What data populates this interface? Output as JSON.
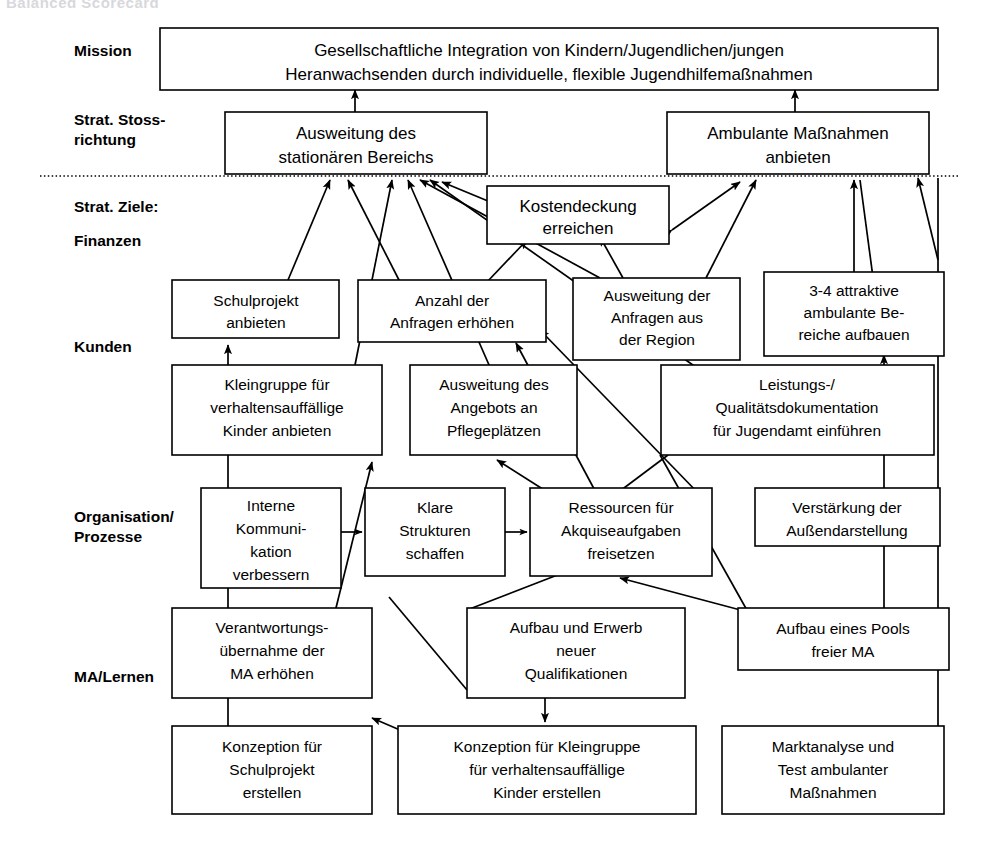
{
  "page": {
    "title": "Balanced Scorecard",
    "width": 1001,
    "height": 841,
    "background": "#ffffff",
    "ink": "#000000"
  },
  "row_labels": [
    {
      "id": "mission",
      "lines": [
        "Mission"
      ]
    },
    {
      "id": "stossrichtung",
      "lines": [
        "Strat. Stoss-",
        "richtung"
      ]
    },
    {
      "id": "ziele",
      "lines": [
        "Strat. Ziele:"
      ]
    },
    {
      "id": "finanzen",
      "lines": [
        "Finanzen"
      ]
    },
    {
      "id": "kunden",
      "lines": [
        "Kunden"
      ]
    },
    {
      "id": "organisation",
      "lines": [
        "Organisation/",
        "Prozesse"
      ]
    },
    {
      "id": "malernen",
      "lines": [
        "MA/Lernen"
      ]
    }
  ],
  "boxes": [
    {
      "id": "mission",
      "lines": [
        "Gesellschaftliche Integration von Kindern/Jugendlichen/jungen",
        "Heranwachsenden durch individuelle, flexible Jugendhilfemaßnahmen"
      ]
    },
    {
      "id": "ausweitung-stat",
      "lines": [
        "Ausweitung des",
        "stationären Bereichs"
      ]
    },
    {
      "id": "ambulante-massn",
      "lines": [
        "Ambulante Maßnahmen",
        "anbieten"
      ]
    },
    {
      "id": "kostendeckung",
      "lines": [
        "Kostendeckung",
        "erreichen"
      ]
    },
    {
      "id": "schulprojekt",
      "lines": [
        "Schulprojekt",
        "anbieten"
      ]
    },
    {
      "id": "anzahl-anfragen",
      "lines": [
        "Anzahl der",
        "Anfragen erhöhen"
      ]
    },
    {
      "id": "ausweitung-region",
      "lines": [
        "Ausweitung der",
        "Anfragen aus",
        "der Region"
      ]
    },
    {
      "id": "attraktive-bereiche",
      "lines": [
        "3-4 attraktive",
        "ambulante Be-",
        "reiche aufbauen"
      ]
    },
    {
      "id": "kleingruppe",
      "lines": [
        "Kleingruppe für",
        "verhaltensauffällige",
        "Kinder anbieten"
      ]
    },
    {
      "id": "pflegeplaetze",
      "lines": [
        "Ausweitung des",
        "Angebots an",
        "Pflegeplätzen"
      ]
    },
    {
      "id": "qualitaetsdok",
      "lines": [
        "Leistungs-/",
        "Qualitätsdokumentation",
        "für Jugendamt einführen"
      ]
    },
    {
      "id": "interne-kommu",
      "lines": [
        "Interne",
        "Kommuni-",
        "kation",
        "verbessern"
      ]
    },
    {
      "id": "klare-strukturen",
      "lines": [
        "Klare",
        "Strukturen",
        "schaffen"
      ]
    },
    {
      "id": "ressourcen-akquise",
      "lines": [
        "Ressourcen für",
        "Akquiseaufgaben",
        "freisetzen"
      ]
    },
    {
      "id": "aussendarstellung",
      "lines": [
        "Verstärkung der",
        "Außendarstellung"
      ]
    },
    {
      "id": "verantwortung",
      "lines": [
        "Verantwortungs-",
        "übernahme der",
        "MA erhöhen"
      ]
    },
    {
      "id": "qualifikationen",
      "lines": [
        "Aufbau und Erwerb",
        "neuer",
        "Qualifikationen"
      ]
    },
    {
      "id": "pool-freier-ma",
      "lines": [
        "Aufbau eines Pools",
        "freier MA"
      ]
    },
    {
      "id": "konzept-schul",
      "lines": [
        "Konzeption für",
        "Schulprojekt",
        "erstellen"
      ]
    },
    {
      "id": "konzept-kleingruppe",
      "lines": [
        "Konzeption für Kleingruppe",
        "für verhaltensauffällige",
        "Kinder erstellen"
      ]
    },
    {
      "id": "marktanalyse",
      "lines": [
        "Marktanalyse und",
        "Test  ambulanter",
        "Maßnahmen"
      ]
    }
  ],
  "links": [
    {
      "from": "ausweitung-stat",
      "to": "mission",
      "kind": "arrow"
    },
    {
      "from": "ambulante-massn",
      "to": "mission",
      "kind": "arrow"
    },
    {
      "from": "kostendeckung",
      "to": "ausweitung-stat",
      "kind": "arrow"
    },
    {
      "from": "kostendeckung",
      "to": "ambulante-massn",
      "kind": "double-arrow"
    },
    {
      "from": "schulprojekt",
      "to": "ausweitung-stat",
      "kind": "arrow"
    },
    {
      "from": "anzahl-anfragen",
      "to": "ausweitung-stat",
      "kind": "arrow"
    },
    {
      "from": "anzahl-anfragen",
      "to": "kostendeckung",
      "kind": "arrow"
    },
    {
      "from": "ausweitung-region",
      "to": "ausweitung-stat",
      "kind": "arrow"
    },
    {
      "from": "ausweitung-region",
      "to": "kostendeckung",
      "kind": "arrow"
    },
    {
      "from": "ausweitung-region",
      "to": "ambulante-massn",
      "kind": "arrow"
    },
    {
      "from": "attraktive-bereiche",
      "to": "ambulante-massn",
      "kind": "arrow"
    },
    {
      "from": "kleingruppe",
      "to": "ausweitung-stat",
      "kind": "arrow"
    },
    {
      "from": "pflegeplaetze",
      "to": "ausweitung-stat",
      "kind": "arrow"
    },
    {
      "from": "qualitaetsdok",
      "to": "ausweitung-stat",
      "kind": "arrow"
    },
    {
      "from": "interne-kommu",
      "to": "klare-strukturen",
      "kind": "arrow"
    },
    {
      "from": "klare-strukturen",
      "to": "ressourcen-akquise",
      "kind": "arrow"
    },
    {
      "from": "ressourcen-akquise",
      "to": "anzahl-anfragen",
      "kind": "arrow"
    },
    {
      "from": "ressourcen-akquise",
      "to": "pflegeplaetze",
      "kind": "arrow"
    },
    {
      "from": "aussendarstellung",
      "to": "anzahl-anfragen",
      "kind": "arrow"
    },
    {
      "from": "verantwortung",
      "to": "kleingruppe",
      "kind": "arrow"
    },
    {
      "from": "qualifikationen",
      "to": "ressourcen-akquise",
      "kind": "arrow"
    },
    {
      "from": "qualifikationen",
      "to": "konzept-kleingruppe",
      "kind": "arrow"
    },
    {
      "from": "pool-freier-ma",
      "to": "ressourcen-akquise",
      "kind": "arrow"
    },
    {
      "from": "pool-freier-ma",
      "to": "attraktive-bereiche",
      "kind": "arrow"
    },
    {
      "from": "konzept-schul",
      "to": "schulprojekt",
      "kind": "arrow"
    },
    {
      "from": "konzept-kleingruppe",
      "to": "konzept-schul",
      "kind": "arrow"
    },
    {
      "from": "marktanalyse",
      "to": "ambulante-massn",
      "kind": "arrow"
    }
  ],
  "separator": {
    "id": "dotted-separator",
    "y": 176,
    "style": "dotted"
  }
}
